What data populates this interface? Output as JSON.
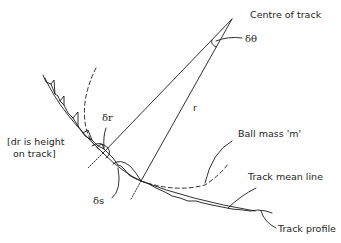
{
  "diagram": {
    "type": "physics-geometry",
    "labels": {
      "centre": "Centre of track",
      "delta_theta": "δθ",
      "radius": "r",
      "delta_r": "δr",
      "note_line1": "[dr is height",
      "note_line2": "on track]",
      "ball": "Ball mass 'm'",
      "delta_s": "δs",
      "mean_line": "Track mean line",
      "profile": "Track profile"
    },
    "colors": {
      "stroke": "#1a1a1a",
      "background": "#ffffff"
    }
  }
}
